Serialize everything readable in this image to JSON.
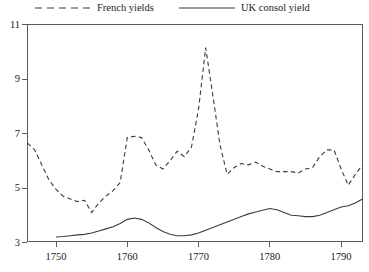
{
  "chart_data": {
    "type": "line",
    "title": "",
    "xlabel": "",
    "ylabel": "",
    "xlim": [
      1746,
      1793
    ],
    "ylim": [
      3,
      11
    ],
    "grid": false,
    "legend_position": "top",
    "yticks": [
      3,
      5,
      7,
      9,
      11
    ],
    "xticks": [
      1750,
      1760,
      1770,
      1780,
      1790
    ],
    "ytick_labels": [
      "3",
      "5",
      "7",
      "9",
      "11"
    ],
    "xtick_labels": [
      "1750",
      "1760",
      "1770",
      "1780",
      "1790"
    ],
    "series": [
      {
        "name": "French yields",
        "style": "dashed",
        "color": "#3b3b3b",
        "x": [
          1746,
          1747,
          1748,
          1749,
          1750,
          1751,
          1752,
          1753,
          1754,
          1755,
          1756,
          1757,
          1758,
          1759,
          1760,
          1761,
          1762,
          1763,
          1764,
          1765,
          1766,
          1767,
          1768,
          1769,
          1770,
          1771,
          1772,
          1773,
          1774,
          1775,
          1776,
          1777,
          1778,
          1779,
          1780,
          1781,
          1782,
          1783,
          1784,
          1785,
          1786,
          1787,
          1788,
          1789,
          1790,
          1791,
          1792,
          1793
        ],
        "values": [
          6.65,
          6.4,
          5.85,
          5.3,
          4.95,
          4.7,
          4.6,
          4.5,
          4.55,
          4.1,
          4.45,
          4.7,
          4.9,
          5.2,
          6.85,
          6.9,
          6.85,
          6.4,
          5.85,
          5.7,
          6.0,
          6.35,
          6.15,
          6.5,
          7.9,
          10.15,
          8.4,
          6.6,
          5.5,
          5.75,
          5.9,
          5.85,
          5.95,
          5.8,
          5.7,
          5.6,
          5.6,
          5.6,
          5.55,
          5.7,
          5.75,
          6.15,
          6.4,
          6.4,
          5.7,
          5.1,
          5.5,
          5.85
        ]
      },
      {
        "name": "UK consol yield",
        "style": "solid",
        "color": "#3b3b3b",
        "x": [
          1750,
          1751,
          1752,
          1753,
          1754,
          1755,
          1756,
          1757,
          1758,
          1759,
          1760,
          1761,
          1762,
          1763,
          1764,
          1765,
          1766,
          1767,
          1768,
          1769,
          1770,
          1771,
          1772,
          1773,
          1774,
          1775,
          1776,
          1777,
          1778,
          1779,
          1780,
          1781,
          1782,
          1783,
          1784,
          1785,
          1786,
          1787,
          1788,
          1789,
          1790,
          1791,
          1792,
          1793
        ],
        "values": [
          3.2,
          3.22,
          3.25,
          3.28,
          3.3,
          3.35,
          3.42,
          3.5,
          3.58,
          3.7,
          3.85,
          3.9,
          3.85,
          3.72,
          3.55,
          3.4,
          3.3,
          3.25,
          3.25,
          3.28,
          3.35,
          3.45,
          3.55,
          3.65,
          3.75,
          3.85,
          3.95,
          4.05,
          4.12,
          4.18,
          4.25,
          4.2,
          4.1,
          4.0,
          3.98,
          3.95,
          3.95,
          4.0,
          4.1,
          4.2,
          4.3,
          4.35,
          4.45,
          4.6
        ]
      }
    ]
  },
  "legend": {
    "french": {
      "label": "French yields",
      "marker": "dashed-line-swatch"
    },
    "uk": {
      "label": "UK consol yield",
      "marker": "solid-line-swatch"
    }
  }
}
